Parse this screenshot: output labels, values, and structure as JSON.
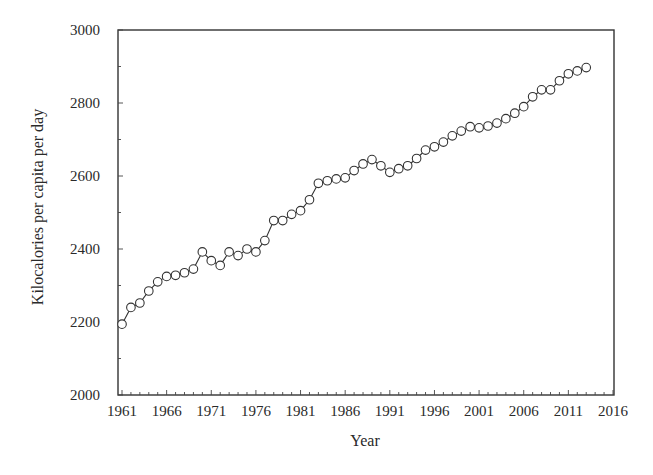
{
  "chart_data": {
    "type": "line",
    "title": "",
    "xlabel": "Year",
    "ylabel": "Kilocalories per capita per day",
    "xlim": [
      1960.4,
      2016
    ],
    "ylim": [
      2000,
      3000
    ],
    "x_ticks": [
      1961,
      1966,
      1971,
      1976,
      1981,
      1986,
      1991,
      1996,
      2001,
      2006,
      2011,
      2016
    ],
    "y_ticks": [
      2000,
      2200,
      2400,
      2600,
      2800,
      3000
    ],
    "grid": false,
    "legend": null,
    "marker": "open-circle",
    "line_color": "#333333",
    "x": [
      1961,
      1962,
      1963,
      1964,
      1965,
      1966,
      1967,
      1968,
      1969,
      1970,
      1971,
      1972,
      1973,
      1974,
      1975,
      1976,
      1977,
      1978,
      1979,
      1980,
      1981,
      1982,
      1983,
      1984,
      1985,
      1986,
      1987,
      1988,
      1989,
      1990,
      1991,
      1992,
      1993,
      1994,
      1995,
      1996,
      1997,
      1998,
      1999,
      2000,
      2001,
      2002,
      2003,
      2004,
      2005,
      2006,
      2007,
      2008,
      2009,
      2010,
      2011,
      2012,
      2013
    ],
    "series": [
      {
        "name": "Kilocalories per capita per day",
        "values": [
          2194,
          2240,
          2252,
          2285,
          2310,
          2325,
          2328,
          2335,
          2345,
          2392,
          2368,
          2355,
          2392,
          2382,
          2400,
          2392,
          2423,
          2478,
          2478,
          2495,
          2505,
          2535,
          2580,
          2587,
          2592,
          2595,
          2615,
          2633,
          2645,
          2628,
          2610,
          2620,
          2628,
          2648,
          2671,
          2680,
          2693,
          2710,
          2723,
          2735,
          2732,
          2737,
          2745,
          2757,
          2772,
          2790,
          2817,
          2836,
          2836,
          2861,
          2880,
          2888,
          2897
        ]
      }
    ]
  },
  "labels": {
    "xlabel": "Year",
    "ylabel": "Kilocalories per capita per day"
  }
}
